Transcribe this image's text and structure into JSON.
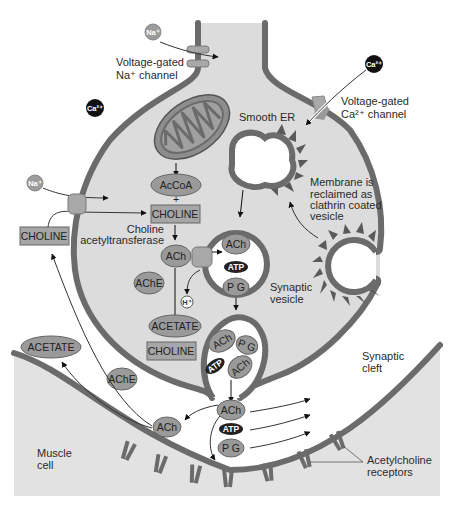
{
  "diagram": {
    "type": "neuromuscular-junction",
    "colors": {
      "membrane": "#6b6b6b",
      "terminal_fill": "#dcdcdc",
      "muscle_fill": "#e2e2e2",
      "oval_fill": "#9a9a9a",
      "box_fill": "#a6a6a6",
      "atp_fill": "#222222",
      "ca_ion_fill": "#111111",
      "na_ion_fill": "#9c9c9c",
      "channel_fill": "#a8a8a8"
    },
    "labels": {
      "na_channel_line1": "Voltage-gated",
      "na_channel_line2": "Na⁺ channel",
      "ca_channel_line1": "Voltage-gated",
      "ca_channel_line2": "Ca²⁺ channel",
      "smooth_er": "Smooth ER",
      "membrane_line1": "Membrane is",
      "membrane_line2": "reclaimed as",
      "membrane_line3": "clathrin coated",
      "membrane_line4": "vesicle",
      "enzyme_line1": "Choline",
      "enzyme_line2": "acetyltransferase",
      "synaptic_vesicle_line1": "Synaptic",
      "synaptic_vesicle_line2": "vesicle",
      "synaptic_cleft_line1": "Synaptic",
      "synaptic_cleft_line2": "cleft",
      "muscle_line1": "Muscle",
      "muscle_line2": "cell",
      "receptors_line1": "Acetylcholine",
      "receptors_line2": "receptors"
    },
    "ions": {
      "na_top": "Na⁺",
      "na_left": "Na⁺",
      "ca_left": "Ca²⁺",
      "ca_right": "Ca²⁺",
      "h_plus": "H⁺"
    },
    "molecules": {
      "accoa": "AcCoA",
      "plus": "+",
      "choline_inside": "CHOLINE",
      "ach_cytosol": "ACh",
      "ache_inside": "AChE",
      "acetate_inside": "ACETATE",
      "choline_inside_lower": "CHOLINE",
      "choline_outside": "CHOLINE",
      "acetate_outside": "ACETATE",
      "ache_outside": "AChE",
      "ach_cleft_left": "ACh",
      "vesicle1_ach": "ACh",
      "vesicle1_atp": "ATP",
      "vesicle1_pg": "P G",
      "vesicle2_ach1": "ACh",
      "vesicle2_pg": "P G",
      "vesicle2_atp": "ATP",
      "vesicle2_ach2": "ACh",
      "released_ach": "ACh",
      "released_atp": "ATP",
      "released_pg": "P G"
    }
  }
}
